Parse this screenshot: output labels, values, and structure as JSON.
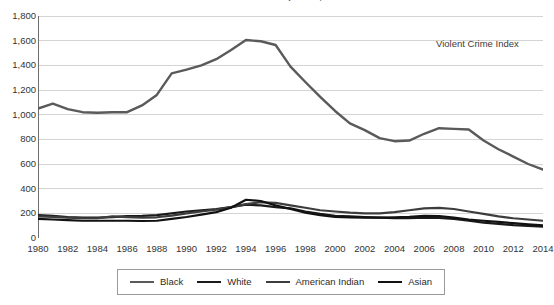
{
  "chart_data": {
    "type": "line",
    "title": "Juvenile Arrest Rates by Race, 1980-2014",
    "annotation": "Violent Crime Index",
    "xlabel": "",
    "ylabel": "",
    "xlim": [
      1980,
      2014
    ],
    "ylim": [
      0,
      1800
    ],
    "grid": true,
    "legend_position": "bottom",
    "y_ticks": [
      "0",
      "200",
      "400",
      "600",
      "800",
      "1,000",
      "1,200",
      "1,400",
      "1,600",
      "1,800"
    ],
    "y_tick_values": [
      0,
      200,
      400,
      600,
      800,
      1000,
      1200,
      1400,
      1600,
      1800
    ],
    "x_ticks": [
      "1980",
      "1982",
      "1984",
      "1986",
      "1988",
      "1990",
      "1992",
      "1994",
      "1996",
      "1998",
      "2000",
      "2002",
      "2004",
      "2006",
      "2008",
      "2010",
      "2012",
      "2014"
    ],
    "x_tick_values": [
      1980,
      1982,
      1984,
      1986,
      1988,
      1990,
      1992,
      1994,
      1996,
      1998,
      2000,
      2002,
      2004,
      2006,
      2008,
      2010,
      2012,
      2014
    ],
    "x": [
      1980,
      1981,
      1982,
      1983,
      1984,
      1985,
      1986,
      1987,
      1988,
      1989,
      1990,
      1991,
      1992,
      1993,
      1994,
      1995,
      1996,
      1997,
      1998,
      1999,
      2000,
      2001,
      2002,
      2003,
      2004,
      2005,
      2006,
      2007,
      2008,
      2009,
      2010,
      2011,
      2012,
      2013,
      2014
    ],
    "series": [
      {
        "name": "Black",
        "color": "#5a5a5a",
        "width": 2.4,
        "values": [
          1050,
          1090,
          1045,
          1020,
          1015,
          1020,
          1020,
          1075,
          1160,
          1335,
          1365,
          1400,
          1450,
          1525,
          1605,
          1595,
          1565,
          1390,
          1265,
          1145,
          1030,
          930,
          875,
          810,
          785,
          790,
          845,
          890,
          885,
          880,
          790,
          720,
          660,
          600,
          555
        ]
      },
      {
        "name": "White",
        "color": "#1a1a1a",
        "width": 2.2,
        "values": [
          185,
          180,
          170,
          165,
          165,
          170,
          178,
          180,
          185,
          200,
          215,
          225,
          235,
          250,
          270,
          265,
          250,
          240,
          215,
          195,
          180,
          175,
          170,
          165,
          160,
          160,
          165,
          162,
          155,
          140,
          125,
          115,
          105,
          98,
          92
        ]
      },
      {
        "name": "American Indian",
        "color": "#3d3d3d",
        "width": 2.2,
        "values": [
          175,
          172,
          165,
          160,
          160,
          175,
          170,
          165,
          168,
          182,
          200,
          215,
          230,
          250,
          275,
          290,
          285,
          265,
          245,
          225,
          215,
          205,
          200,
          200,
          210,
          225,
          240,
          245,
          235,
          215,
          195,
          175,
          160,
          150,
          140
        ]
      },
      {
        "name": "Asian",
        "color": "#111111",
        "width": 2.2,
        "values": [
          155,
          150,
          145,
          140,
          140,
          140,
          140,
          138,
          140,
          155,
          170,
          190,
          210,
          245,
          310,
          300,
          265,
          235,
          205,
          185,
          172,
          168,
          165,
          165,
          168,
          172,
          180,
          178,
          165,
          150,
          140,
          130,
          120,
          110,
          102
        ]
      }
    ]
  },
  "legend": {
    "items": [
      {
        "label": "Black"
      },
      {
        "label": "White"
      },
      {
        "label": "American Indian"
      },
      {
        "label": "Asian"
      }
    ]
  }
}
